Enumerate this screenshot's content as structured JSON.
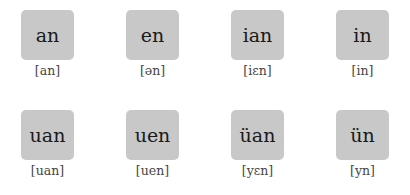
{
  "finals": [
    {
      "pinyin": "an",
      "ipa": "[an]"
    },
    {
      "pinyin": "en",
      "ipa": "[ən]"
    },
    {
      "pinyin": "ian",
      "ipa": "[iɛn]"
    },
    {
      "pinyin": "in",
      "ipa": "[in]"
    },
    {
      "pinyin": "uan",
      "ipa": "[uan]"
    },
    {
      "pinyin": "uen",
      "ipa": "[uen]"
    },
    {
      "pinyin": "üan",
      "ipa": "[yɛn]"
    },
    {
      "pinyin": "ün",
      "ipa": "[yn]"
    }
  ]
}
